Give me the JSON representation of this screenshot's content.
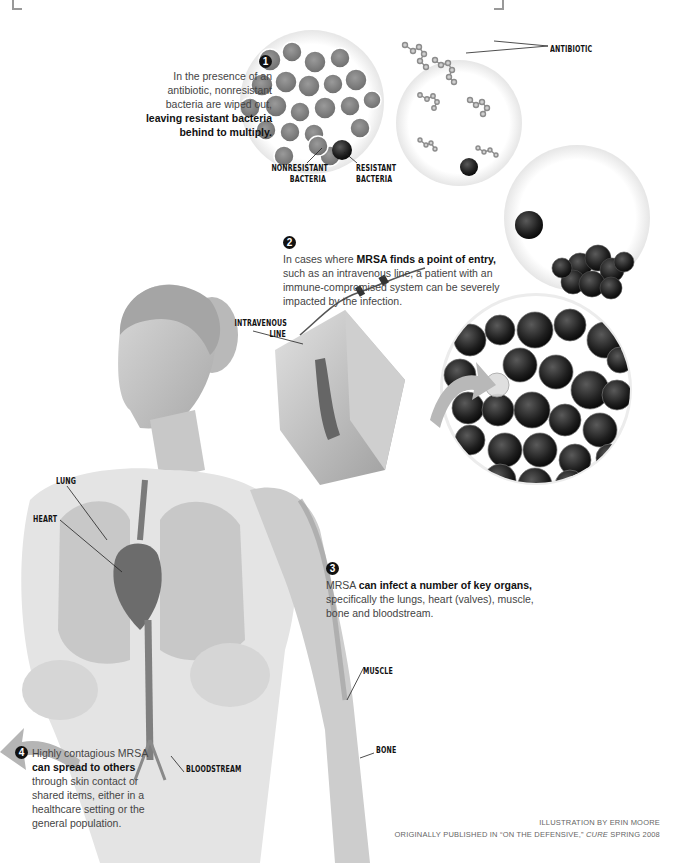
{
  "figure": {
    "type": "medical illustration"
  },
  "labels": {
    "antibiotic": "ANTIBIOTIC",
    "nonresistant_bacteria": [
      "NONRESISTANT",
      "BACTERIA"
    ],
    "resistant_bacteria": [
      "RESISTANT",
      "BACTERIA"
    ],
    "intravenous_line": [
      "INTRAVENOUS",
      "LINE"
    ],
    "lung": "LUNG",
    "heart": "HEART",
    "muscle": "MUSCLE",
    "bone": "BONE",
    "bloodstream": "BLOODSTREAM"
  },
  "steps": [
    {
      "number": "1",
      "lines": [
        {
          "text": "In the presence of an",
          "bold": false
        },
        {
          "text": "antibiotic, nonresistant",
          "bold": false
        },
        {
          "text": "bacteria are wiped out,",
          "bold": false
        },
        {
          "text": "leaving resistant bacteria",
          "bold": true
        },
        {
          "text": "behind to multiply.",
          "bold": true
        }
      ]
    },
    {
      "number": "2",
      "prefix": "In cases where ",
      "bold": "MRSA finds a point of entry,",
      "rest": [
        "such as an intravenous line, a patient with an",
        "immune-compromised system can be severely",
        "impacted by the infection."
      ]
    },
    {
      "number": "3",
      "prefix": "MRSA ",
      "bold": "can infect a number of key organs,",
      "rest": [
        "specifically the lungs, heart (valves), muscle,",
        "bone and bloodstream."
      ]
    },
    {
      "number": "4",
      "prefix": "Highly contagious MRSA",
      "bold": "can spread to others",
      "rest": [
        "through skin contact or",
        "shared items, either in a",
        "healthcare setting or the",
        "general population."
      ]
    }
  ],
  "credits": {
    "line1": "ILLUSTRATION BY ERIN MOORE",
    "line2_prefix": "ORIGINALLY PUBLISHED IN “ON THE DEFENSIVE,” ",
    "line2_italic": "CURE",
    "line2_suffix": " SPRING 2008"
  },
  "colors": {
    "text_body": "#444444",
    "text_bold": "#111111",
    "badge": "#111111",
    "bacteria_dark": "#1e1e1e",
    "bacteria_gray": "#8a8a8a",
    "arrow_gray": "#b5b5b5",
    "bracket": "#999999"
  }
}
